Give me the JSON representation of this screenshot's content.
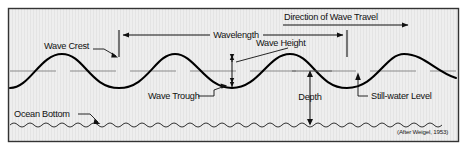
{
  "figure": {
    "attribution": "(After Weigel, 1953)",
    "colors": {
      "panel_background": "#eeeeee",
      "panel_border": "#333333",
      "wave_curve": "#000000",
      "dimension_line": "#111111",
      "still_water_dash": "#777777",
      "text": "#111111",
      "page_background": "#ffffff"
    },
    "labels": {
      "wave_crest": "Wave Crest",
      "wavelength": "Wavelength",
      "wave_height": "Wave Height",
      "direction_of_wave_travel": "Direction of Wave Travel",
      "wave_trough": "Wave Trough",
      "depth": "Depth",
      "still_water_level": "Still-water Level",
      "ocean_bottom": "Ocean Bottom"
    },
    "geometry": {
      "panel": {
        "x": 8,
        "y": 8,
        "width": 451,
        "height": 134
      },
      "still_water_level_y": 71,
      "crest_y": 54,
      "trough_y": 88,
      "ocean_bottom_y": 125,
      "wavelength_span": {
        "x1": 119,
        "x2": 347,
        "y": 35
      },
      "direction_arrow": {
        "x1": 283,
        "x2": 412,
        "y": 25
      },
      "wave_height_arrow": {
        "x": 232,
        "y1": 54,
        "y2": 88
      },
      "depth_arrow": {
        "x": 310,
        "y1": 71,
        "y2": 125
      }
    }
  }
}
